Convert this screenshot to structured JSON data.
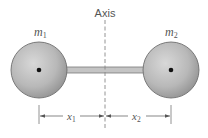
{
  "diagram": {
    "axis_label": "Axis",
    "mass_left": {
      "symbol": "m",
      "subscript": "1"
    },
    "mass_right": {
      "symbol": "m",
      "subscript": "2"
    },
    "distance_left": {
      "symbol": "x",
      "subscript": "1"
    },
    "distance_right": {
      "symbol": "x",
      "subscript": "2"
    }
  },
  "colors": {
    "sphere_fill": "#b5b5b5",
    "sphere_edge": "#6e6e6e",
    "rod_fill": "#c4c4c4",
    "rod_edge": "#7a7a7a",
    "axis_line": "#888888",
    "center_dot": "#111111",
    "text": "#555555"
  }
}
